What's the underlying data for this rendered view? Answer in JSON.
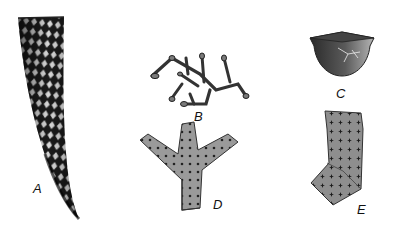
{
  "figure": {
    "specimens": [
      {
        "id": "A",
        "label": "A",
        "description": "elongate curved conical tube with diamond-mesh reticulate surface"
      },
      {
        "id": "B",
        "label": "B",
        "description": "small branching colony of beaded/segmented tubes"
      },
      {
        "id": "C",
        "label": "C",
        "description": "cup-shaped cone with pointed lid/apex and cracked surface"
      },
      {
        "id": "D",
        "label": "D",
        "description": "Y-shaped branching fragment with dotted pores"
      },
      {
        "id": "E",
        "label": "E",
        "description": "bent (L-shaped) cylindrical fragment with star-shaped pits"
      }
    ],
    "colors": {
      "background": "#ffffff",
      "ink": "#111111",
      "mid_gray": "#8a8a8a",
      "light_gray": "#b8b8b8"
    }
  }
}
